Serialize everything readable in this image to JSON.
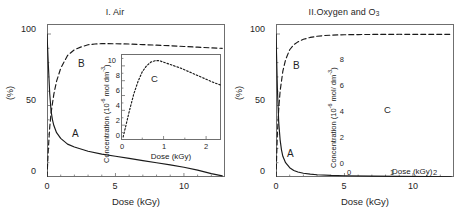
{
  "figure": {
    "background": "#ffffff",
    "axis_color": "#6f6f6f",
    "curve_color": "#1a1a1a"
  },
  "panels": [
    {
      "id": "I",
      "title": "I. Air",
      "title_main": "I. Air",
      "title_sub": "",
      "axes": {
        "ylabel": "(%)",
        "xlabel": "Dose (kGy)",
        "yticks": [
          "0",
          "50",
          "100"
        ],
        "ytick_values": [
          0,
          50,
          100
        ],
        "xticks": [
          "0",
          "5",
          "10"
        ],
        "xtick_values": [
          0,
          5,
          10
        ],
        "xlim": [
          0,
          13
        ],
        "ylim": [
          0,
          107
        ],
        "minor_x_step": 1,
        "minor_y_step": 10
      },
      "curve_labels": {
        "a": "A",
        "b": "B"
      },
      "inset": {
        "ylabel_pre": "Concentration (10",
        "ylabel_sup": "-6",
        "ylabel_post": " mol dm",
        "ylabel_sup2": "-3",
        "ylabel_end": ")",
        "ylabel_full": "Concentration (10-6 mol dm-3)",
        "xlabel": "Dose (kGy)",
        "yticks": [
          "0",
          "2",
          "4",
          "6",
          "8",
          "10"
        ],
        "ytick_values": [
          0,
          2,
          4,
          6,
          8,
          10
        ],
        "xticks": [
          "0",
          "1",
          "2"
        ],
        "xtick_values": [
          0,
          1,
          2
        ],
        "xlim": [
          0,
          2.35
        ],
        "ylim": [
          0,
          11.6
        ],
        "curve_label": "C"
      }
    },
    {
      "id": "II",
      "title": "II.Oxygen and O3",
      "title_main": "II.Oxygen and O",
      "title_sub": "3",
      "axes": {
        "ylabel": "(%)",
        "xlabel": "Dose (kGy)",
        "yticks": [
          "0",
          "50",
          "100"
        ],
        "ytick_values": [
          0,
          50,
          100
        ],
        "xticks": [
          "0",
          "5",
          "10"
        ],
        "xtick_values": [
          0,
          5,
          10
        ],
        "xlim": [
          0,
          13
        ],
        "ylim": [
          0,
          107
        ],
        "minor_x_step": 1,
        "minor_y_step": 10
      },
      "curve_labels": {
        "a": "A",
        "b": "B"
      },
      "inset": {
        "ylabel_pre": "Concentration (10",
        "ylabel_sup": "-6",
        "ylabel_post": " mol/ dm",
        "ylabel_sup2": "-3",
        "ylabel_end": ")",
        "ylabel_full": "Concentration (10-6 mol/ dm-3)",
        "xlabel": "Dose (kGy)",
        "yticks": [
          "0",
          "2",
          "4",
          "6",
          "8"
        ],
        "ytick_values": [
          0,
          2,
          4,
          6,
          8
        ],
        "xticks": [
          "0",
          "1",
          "2"
        ],
        "xtick_values": [
          0,
          1,
          2
        ],
        "xlim": [
          0,
          2.35
        ],
        "ylim": [
          0,
          8.4
        ],
        "curve_label": "C"
      }
    }
  ],
  "chart_data": [
    {
      "type": "line",
      "title": "I. Air",
      "xlabel": "Dose (kGy)",
      "ylabel": "(%)",
      "xlim": [
        0,
        13
      ],
      "ylim": [
        0,
        107
      ],
      "grid": false,
      "legend": "inline-labels",
      "series": [
        {
          "name": "A",
          "style": "solid",
          "label": "A",
          "x": [
            0,
            0.1,
            0.2,
            0.3,
            0.4,
            0.5,
            0.7,
            1.0,
            1.5,
            2.0,
            3.0,
            4.0,
            5.0,
            6.0,
            7.0,
            8.0,
            9.0,
            10.0,
            11.0,
            12.0,
            12.8
          ],
          "y": [
            100,
            78,
            58,
            46,
            40,
            36,
            31,
            27,
            23,
            21,
            18,
            16,
            14.5,
            13,
            11.5,
            10,
            8.5,
            6.8,
            4.8,
            2.4,
            0.8
          ]
        },
        {
          "name": "B",
          "style": "dashed",
          "label": "B",
          "x": [
            0,
            0.1,
            0.2,
            0.3,
            0.5,
            0.7,
            1.0,
            1.5,
            2.0,
            2.5,
            3.0,
            3.5,
            4.0,
            5.0,
            6.0,
            7.0,
            8.0,
            9.0,
            10.0,
            11.0,
            12.0,
            12.8
          ],
          "y": [
            0,
            20,
            35,
            45,
            58,
            67,
            76,
            85,
            89,
            91,
            92.5,
            93,
            93.3,
            93.2,
            93,
            92.6,
            92.2,
            91.8,
            91.3,
            90.8,
            90.3,
            90
          ]
        }
      ],
      "inset": {
        "type": "line",
        "xlabel": "Dose (kGy)",
        "ylabel": "Concentration (10-6 mol dm-3)",
        "xlim": [
          0,
          2.35
        ],
        "ylim": [
          0,
          11.6
        ],
        "series": [
          {
            "name": "C",
            "style": "dotted",
            "label": "C",
            "x": [
              0.05,
              0.1,
              0.2,
              0.3,
              0.4,
              0.5,
              0.6,
              0.7,
              0.8,
              0.9,
              1.0,
              1.2,
              1.4,
              1.6,
              1.8,
              2.0,
              2.2,
              2.35
            ],
            "y": [
              0.4,
              1.6,
              4.0,
              6.2,
              7.9,
              9.2,
              10.0,
              10.5,
              10.7,
              10.7,
              10.5,
              10.1,
              9.7,
              9.2,
              8.7,
              8.2,
              7.7,
              7.4
            ]
          }
        ]
      }
    },
    {
      "type": "line",
      "title": "II.Oxygen and O3",
      "xlabel": "Dose (kGy)",
      "ylabel": "(%)",
      "xlim": [
        0,
        13
      ],
      "ylim": [
        0,
        107
      ],
      "grid": false,
      "legend": "inline-labels",
      "series": [
        {
          "name": "A",
          "style": "solid",
          "label": "A",
          "x": [
            0,
            0.05,
            0.1,
            0.2,
            0.3,
            0.4,
            0.5,
            0.7,
            1.0,
            1.3,
            1.6,
            2.0,
            2.5,
            3.0,
            4.0,
            5.0,
            7.0,
            9.0,
            11.0,
            12.8
          ],
          "y": [
            100,
            82,
            62,
            38,
            26,
            19,
            14.5,
            10,
            6.5,
            4.6,
            3.5,
            2.6,
            2.0,
            1.6,
            1.1,
            0.9,
            0.6,
            0.4,
            0.3,
            0.2
          ]
        },
        {
          "name": "B",
          "style": "dashed",
          "label": "B",
          "x": [
            0,
            0.1,
            0.2,
            0.3,
            0.5,
            0.7,
            1.0,
            1.3,
            1.6,
            2.0,
            2.5,
            3.0,
            3.5,
            4.0,
            5.0,
            6.0,
            7.0,
            8.0,
            9.0,
            10.0,
            11.0,
            12.0,
            12.8
          ],
          "y": [
            0,
            30,
            48,
            60,
            74,
            82,
            89,
            92.5,
            94.5,
            96.3,
            97.6,
            98.4,
            98.9,
            99.2,
            99.5,
            99.6,
            99.7,
            99.7,
            99.8,
            99.8,
            99.8,
            99.8,
            99.8
          ]
        }
      ],
      "inset": {
        "type": "line",
        "xlabel": "Dose (kGy)",
        "ylabel": "Concentration (10-6 mol/ dm-3)",
        "xlim": [
          0,
          2.35
        ],
        "ylim": [
          0,
          8.4
        ],
        "series": [
          {
            "name": "C",
            "style": "dotted",
            "label": "C",
            "x": [
              0.03,
              0.08,
              0.15,
              0.25,
              0.35,
              0.45,
              0.55,
              0.65,
              0.75,
              0.9,
              1.05,
              1.2,
              1.4,
              1.6,
              1.8,
              2.0,
              2.2,
              2.35
            ],
            "y": [
              0.2,
              1.6,
              3.6,
              5.6,
              6.8,
              7.4,
              7.6,
              7.5,
              7.1,
              6.3,
              5.5,
              4.8,
              3.9,
              3.2,
              2.5,
              1.9,
              1.4,
              1.1
            ]
          }
        ]
      }
    }
  ]
}
